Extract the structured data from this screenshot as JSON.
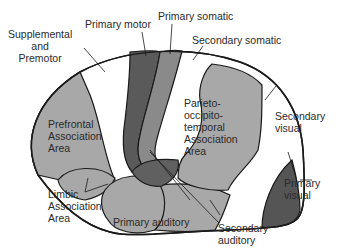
{
  "colors": {
    "outline": "#1a1a1a",
    "association": "#a8a8a8",
    "secondary": "#ffffff",
    "primary_motor": "#5a5a5a",
    "primary_somatic": "#8a8a8a",
    "primary_visual": "#555555",
    "primary_auditory": "#606060"
  },
  "labels": {
    "supplemental_l1": "Supplemental",
    "supplemental_l2": "and",
    "supplemental_l3": "Premotor",
    "primary_motor": "Primary motor",
    "primary_somatic": "Primary somatic",
    "secondary_somatic": "Secondary somatic",
    "prefrontal_l1": "Prefrontal",
    "prefrontal_l2": "Association",
    "prefrontal_l3": "Area",
    "pot_l1": "Parieto-",
    "pot_l2": "occipito-",
    "pot_l3": "temporal",
    "pot_l4": "Association",
    "pot_l5": "Area",
    "secondary_visual_l1": "Secondary",
    "secondary_visual_l2": "visual",
    "primary_visual_l1": "Primary",
    "primary_visual_l2": "visual",
    "limbic_l1": "Limbic",
    "limbic_l2": "Association",
    "limbic_l3": "Area",
    "primary_auditory": "Primary auditory",
    "secondary_auditory_l1": "Secondary",
    "secondary_auditory_l2": "auditory"
  }
}
